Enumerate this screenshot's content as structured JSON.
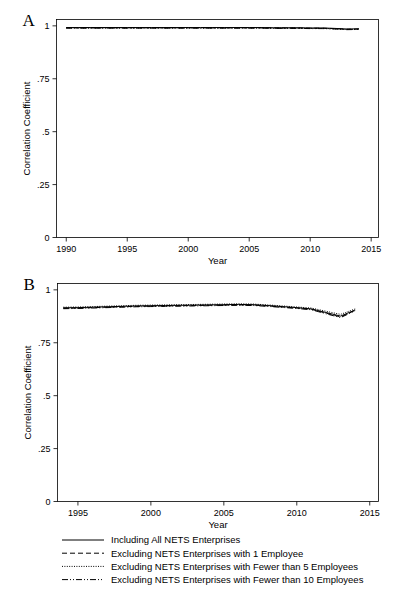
{
  "figure": {
    "panels": [
      {
        "letter": "A",
        "ylabel": "Correlation Coefficient",
        "xlabel": "Year",
        "xticks": [
          1990,
          1995,
          2000,
          2005,
          2010,
          2015
        ],
        "xtick_labels": [
          "1990",
          "1995",
          "2000",
          "2005",
          "2010",
          "2015"
        ],
        "yticks": [
          0,
          0.25,
          0.5,
          0.75,
          1
        ],
        "ytick_labels": [
          "0",
          ".25",
          ".5",
          ".75",
          "1"
        ],
        "xlim": [
          1989.2,
          2015.6
        ],
        "ylim": [
          0,
          1.03
        ]
      },
      {
        "letter": "B",
        "ylabel": "Correlation Coefficient",
        "xlabel": "Year",
        "xticks": [
          1995,
          2000,
          2005,
          2010,
          2015
        ],
        "xtick_labels": [
          "1995",
          "2000",
          "2005",
          "2010",
          "2015"
        ],
        "yticks": [
          0,
          0.25,
          0.5,
          0.75,
          1
        ],
        "ytick_labels": [
          "0",
          ".25",
          ".5",
          ".75",
          "1"
        ],
        "xlim": [
          1993.6,
          2015.6
        ],
        "ylim": [
          0,
          1.03
        ]
      }
    ],
    "legend": {
      "items": [
        {
          "label": "Including All NETS Enterprises",
          "style": "solid"
        },
        {
          "label": "Excluding NETS Enterprises with 1 Employee",
          "style": "dash"
        },
        {
          "label": "Excluding NETS Enterprises with Fewer than 5 Employees",
          "style": "dot"
        },
        {
          "label": "Excluding NETS Enterprises with Fewer than 10 Employees",
          "style": "dashdotdot"
        }
      ]
    },
    "colors": {
      "line": "#000000",
      "axis": "#000000",
      "background": "#ffffff"
    }
  },
  "chart_data": [
    {
      "type": "line",
      "panel": "A",
      "title": "",
      "xlabel": "Year",
      "ylabel": "Correlation Coefficient",
      "xlim": [
        1989.2,
        2015.6
      ],
      "ylim": [
        0,
        1.03
      ],
      "yticks": [
        0,
        0.25,
        0.5,
        0.75,
        1
      ],
      "xticks": [
        1990,
        1995,
        2000,
        2005,
        2010,
        2015
      ],
      "grid": false,
      "legend_position": "below-figure",
      "x": [
        1990,
        1991,
        1992,
        1993,
        1994,
        1995,
        1996,
        1997,
        1998,
        1999,
        2000,
        2001,
        2002,
        2003,
        2004,
        2005,
        2006,
        2007,
        2008,
        2009,
        2010,
        2011,
        2012,
        2013,
        2014
      ],
      "series": [
        {
          "name": "Including All NETS Enterprises",
          "style": "solid",
          "values": [
            0.992,
            0.992,
            0.992,
            0.992,
            0.992,
            0.992,
            0.992,
            0.992,
            0.992,
            0.992,
            0.992,
            0.992,
            0.992,
            0.992,
            0.992,
            0.992,
            0.992,
            0.991,
            0.991,
            0.991,
            0.99,
            0.99,
            0.988,
            0.985,
            0.986
          ]
        },
        {
          "name": "Excluding NETS Enterprises with 1 Employee",
          "style": "dash",
          "values": [
            0.991,
            0.991,
            0.991,
            0.991,
            0.991,
            0.991,
            0.991,
            0.991,
            0.991,
            0.991,
            0.991,
            0.991,
            0.991,
            0.991,
            0.991,
            0.991,
            0.991,
            0.99,
            0.99,
            0.99,
            0.989,
            0.989,
            0.987,
            0.984,
            0.985
          ]
        },
        {
          "name": "Excluding NETS Enterprises with Fewer than 5 Employees",
          "style": "dot",
          "values": [
            0.99,
            0.99,
            0.99,
            0.99,
            0.99,
            0.99,
            0.99,
            0.99,
            0.99,
            0.99,
            0.99,
            0.99,
            0.99,
            0.99,
            0.99,
            0.99,
            0.99,
            0.989,
            0.989,
            0.989,
            0.988,
            0.988,
            0.986,
            0.983,
            0.984
          ]
        },
        {
          "name": "Excluding NETS Enterprises with Fewer than 10 Employees",
          "style": "dashdotdot",
          "values": [
            0.989,
            0.989,
            0.989,
            0.989,
            0.989,
            0.989,
            0.989,
            0.989,
            0.989,
            0.989,
            0.989,
            0.989,
            0.989,
            0.989,
            0.989,
            0.989,
            0.989,
            0.988,
            0.988,
            0.988,
            0.987,
            0.987,
            0.985,
            0.982,
            0.983
          ]
        }
      ]
    },
    {
      "type": "line",
      "panel": "B",
      "title": "",
      "xlabel": "Year",
      "ylabel": "Correlation Coefficient",
      "xlim": [
        1993.6,
        2015.6
      ],
      "ylim": [
        0,
        1.03
      ],
      "yticks": [
        0,
        0.25,
        0.5,
        0.75,
        1
      ],
      "xticks": [
        1995,
        2000,
        2005,
        2010,
        2015
      ],
      "grid": false,
      "legend_position": "below-figure",
      "x": [
        1994,
        1995,
        1996,
        1997,
        1998,
        1999,
        2000,
        2001,
        2002,
        2003,
        2004,
        2005,
        2006,
        2007,
        2008,
        2009,
        2010,
        2011,
        2012,
        2013,
        2014
      ],
      "series": [
        {
          "name": "Including All NETS Enterprises",
          "style": "solid",
          "values": [
            0.915,
            0.916,
            0.918,
            0.92,
            0.922,
            0.924,
            0.925,
            0.926,
            0.927,
            0.928,
            0.929,
            0.93,
            0.931,
            0.93,
            0.926,
            0.921,
            0.916,
            0.91,
            0.893,
            0.876,
            0.905
          ]
        },
        {
          "name": "Excluding NETS Enterprises with 1 Employee",
          "style": "dash",
          "values": [
            0.913,
            0.914,
            0.916,
            0.918,
            0.92,
            0.922,
            0.923,
            0.924,
            0.925,
            0.926,
            0.927,
            0.928,
            0.929,
            0.928,
            0.924,
            0.919,
            0.914,
            0.908,
            0.89,
            0.872,
            0.903
          ]
        },
        {
          "name": "Excluding NETS Enterprises with Fewer than 5 Employees",
          "style": "dot",
          "values": [
            0.918,
            0.919,
            0.921,
            0.923,
            0.925,
            0.927,
            0.928,
            0.929,
            0.93,
            0.931,
            0.932,
            0.933,
            0.934,
            0.933,
            0.929,
            0.924,
            0.919,
            0.914,
            0.899,
            0.884,
            0.91
          ]
        },
        {
          "name": "Excluding NETS Enterprises with Fewer than 10 Employees",
          "style": "dashdotdot",
          "values": [
            0.911,
            0.912,
            0.914,
            0.916,
            0.918,
            0.92,
            0.921,
            0.922,
            0.923,
            0.924,
            0.925,
            0.926,
            0.927,
            0.926,
            0.922,
            0.917,
            0.912,
            0.906,
            0.887,
            0.869,
            0.901
          ]
        }
      ]
    }
  ]
}
